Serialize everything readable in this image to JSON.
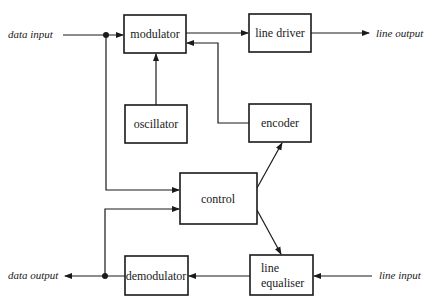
{
  "diagram": {
    "type": "block-diagram",
    "blocks": {
      "modulator": {
        "label": "modulator",
        "x": 124,
        "y": 15,
        "w": 62,
        "h": 38
      },
      "line_driver": {
        "label": "line driver",
        "x": 249,
        "y": 14,
        "w": 62,
        "h": 38
      },
      "oscillator": {
        "label": "oscillator",
        "x": 125,
        "y": 105,
        "w": 62,
        "h": 38
      },
      "encoder": {
        "label": "encoder",
        "x": 249,
        "y": 104,
        "w": 62,
        "h": 38
      },
      "control": {
        "label": "control",
        "x": 180,
        "y": 173,
        "w": 77,
        "h": 51
      },
      "demodulator": {
        "label": "demodulator",
        "x": 125,
        "y": 256,
        "w": 63,
        "h": 39
      },
      "line_equaliser": {
        "label_line1": "line",
        "label_line2": "equaliser",
        "x": 250,
        "y": 255,
        "w": 63,
        "h": 40
      }
    },
    "external_labels": {
      "data_input": "data input",
      "line_output": "line output",
      "data_output": "data output",
      "line_input": "line input"
    },
    "connections": [
      {
        "from": "data input",
        "to": "modulator"
      },
      {
        "from": "data input",
        "to": "control"
      },
      {
        "from": "oscillator",
        "to": "modulator"
      },
      {
        "from": "encoder",
        "to": "modulator"
      },
      {
        "from": "modulator",
        "to": "line driver"
      },
      {
        "from": "line driver",
        "to": "line output"
      },
      {
        "from": "control",
        "to": "encoder"
      },
      {
        "from": "control",
        "to": "line equaliser"
      },
      {
        "from": "line input",
        "to": "line equaliser"
      },
      {
        "from": "line equaliser",
        "to": "demodulator"
      },
      {
        "from": "demodulator",
        "to": "data output"
      },
      {
        "from": "demodulator",
        "to": "control"
      }
    ],
    "colors": {
      "ink": "#1a1a1a",
      "background": "#ffffff"
    }
  }
}
